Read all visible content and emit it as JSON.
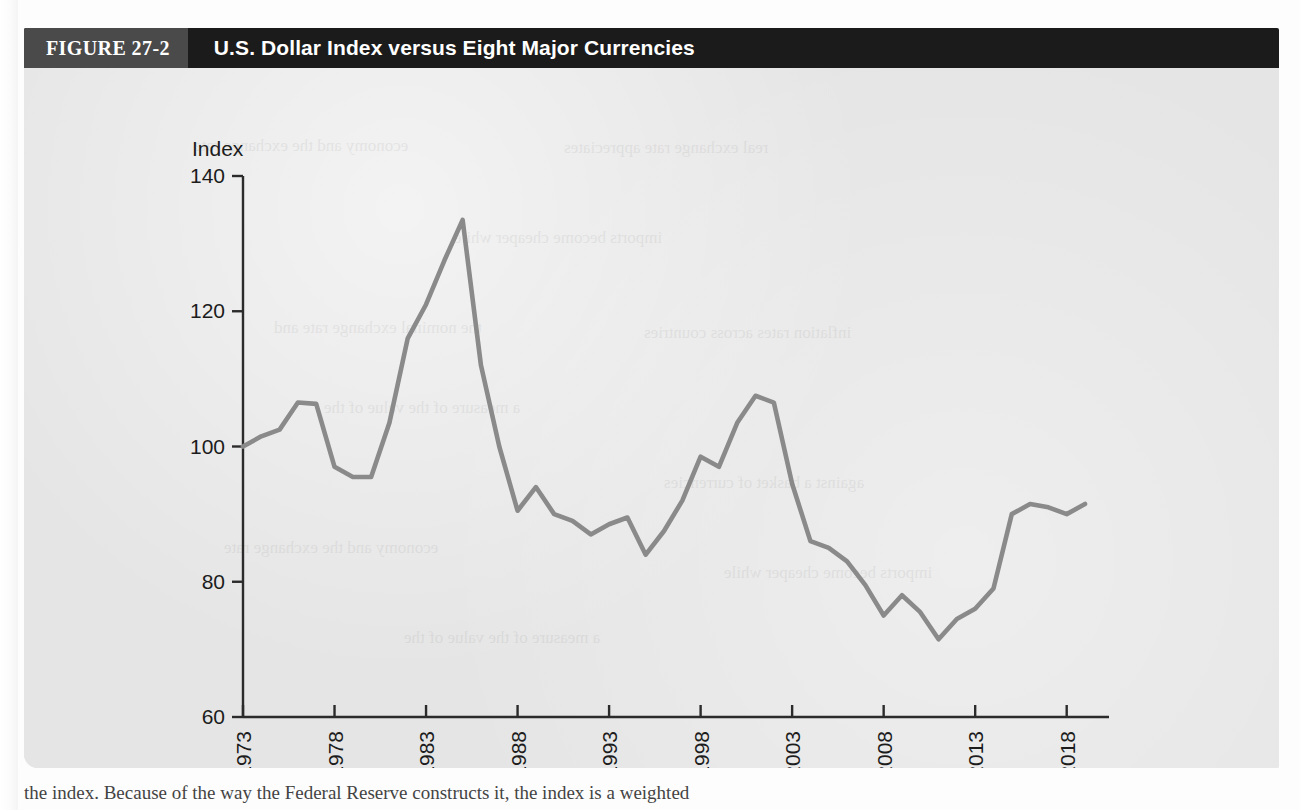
{
  "figure": {
    "number_label": "FIGURE 27-2",
    "title": "U.S. Dollar Index versus Eight Major Currencies"
  },
  "caption_partial": "the index. Because of the way the Federal Reserve constructs it, the index is a weighted",
  "ghost_text": [
    "economy and the exchange rate",
    "real exchange rate appreciates",
    "imports become cheaper while",
    "the nominal exchange rate and",
    "inflation rates across countries",
    "a measure of the value of the",
    "against a basket of currencies"
  ],
  "colors": {
    "header_bar": "#1b1b1b",
    "figure_tag": "#4a4a4a",
    "plot_background": "#e5e5e5",
    "line": "#8a8a8a",
    "axis": "#2b2b2b",
    "text": "#1c1c1c"
  },
  "chart_data": {
    "type": "line",
    "title": "U.S. Dollar Index versus Eight Major Currencies",
    "xlabel": "Year",
    "ylabel": "Index",
    "ylim": [
      60,
      140
    ],
    "xlim": [
      1973,
      2019
    ],
    "yticks": [
      60,
      80,
      100,
      120,
      140
    ],
    "xticks": [
      1973,
      1978,
      1983,
      1988,
      1993,
      1998,
      2003,
      2008,
      2013,
      2018
    ],
    "grid": false,
    "legend": null,
    "series": [
      {
        "name": "U.S. Dollar Index",
        "x": [
          1973,
          1974,
          1975,
          1976,
          1977,
          1978,
          1979,
          1980,
          1981,
          1982,
          1983,
          1984,
          1985,
          1986,
          1987,
          1988,
          1989,
          1990,
          1991,
          1992,
          1993,
          1994,
          1995,
          1996,
          1997,
          1998,
          1999,
          2000,
          2001,
          2002,
          2003,
          2004,
          2005,
          2006,
          2007,
          2008,
          2009,
          2010,
          2011,
          2012,
          2013,
          2014,
          2015,
          2016,
          2017,
          2018,
          2019
        ],
        "values": [
          100.0,
          101.5,
          102.5,
          106.5,
          106.3,
          97.0,
          95.5,
          95.5,
          103.5,
          116.0,
          121.0,
          127.5,
          133.5,
          112.0,
          100.0,
          90.5,
          94.0,
          90.0,
          89.0,
          87.0,
          88.5,
          89.5,
          84.0,
          87.5,
          92.0,
          98.5,
          97.0,
          103.5,
          107.5,
          106.5,
          94.5,
          86.0,
          85.0,
          83.0,
          79.5,
          75.0,
          78.0,
          75.5,
          71.5,
          74.5,
          76.0,
          79.0,
          90.0,
          91.5,
          91.0,
          90.0,
          91.5
        ]
      }
    ]
  }
}
